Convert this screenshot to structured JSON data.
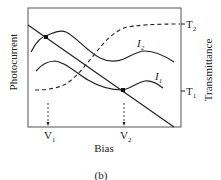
{
  "figure": {
    "panel_label": "(b)",
    "x_axis_label": "Bias",
    "left_axis_label": "Photocurrent",
    "right_axis_label": "Transmittance",
    "x_markers": [
      {
        "label": "V",
        "sub": "1"
      },
      {
        "label": "V",
        "sub": "2"
      }
    ],
    "right_ticks": [
      {
        "label": "T",
        "sub": "2"
      },
      {
        "label": "T",
        "sub": "1"
      }
    ],
    "curves": [
      {
        "label": "I",
        "sub": "2",
        "style": "solid"
      },
      {
        "label": "I",
        "sub": "1",
        "style": "solid"
      },
      {
        "label": "load line",
        "style": "solid"
      },
      {
        "label": "transmittance",
        "style": "dashed"
      }
    ]
  },
  "colors": {
    "line": "#222222",
    "background": "#ffffff"
  }
}
